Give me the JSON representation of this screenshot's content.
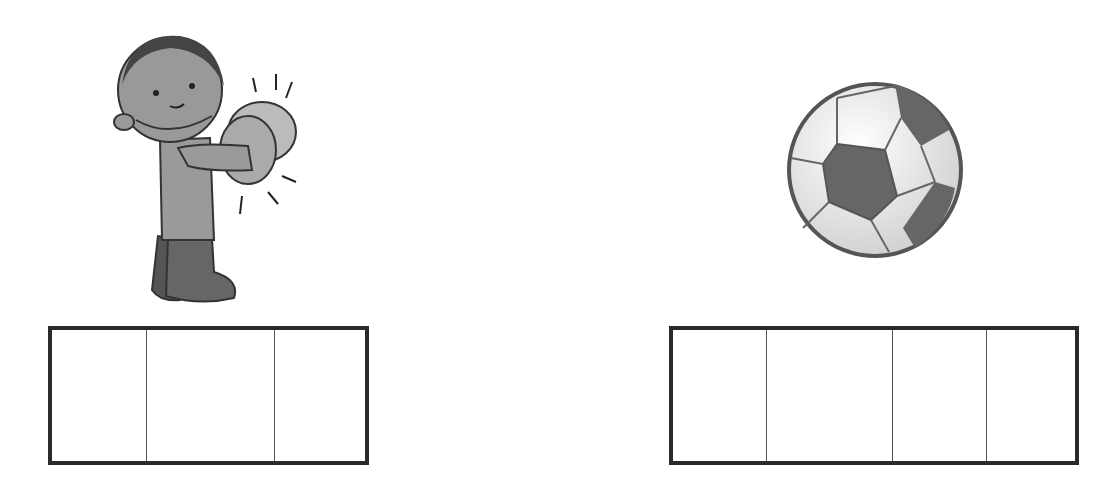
{
  "worksheet": {
    "items": [
      {
        "picture": "boy-playing-cymbals-icon",
        "word_box": {
          "cells": 3,
          "cell_widths_px": [
            95,
            128,
            97
          ],
          "values": [
            "",
            "",
            ""
          ]
        }
      },
      {
        "picture": "soccer-ball-icon",
        "word_box": {
          "cells": 4,
          "cell_widths_px": [
            96,
            125,
            95,
            93
          ],
          "values": [
            "",
            "",
            "",
            ""
          ]
        }
      }
    ]
  },
  "colors": {
    "outline": "#2a2a2a",
    "divider": "#555555",
    "background": "#ffffff"
  }
}
